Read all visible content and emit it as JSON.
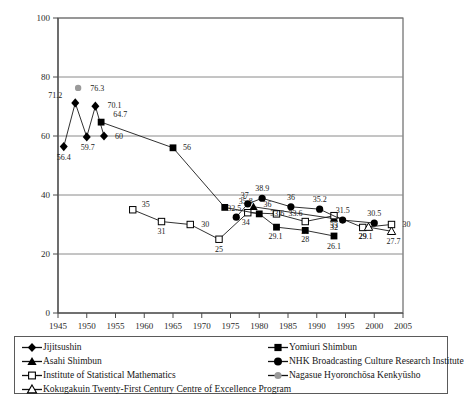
{
  "chart_data": {
    "type": "line",
    "title": "",
    "xlabel": "",
    "ylabel": "",
    "xlim": [
      1945,
      2005
    ],
    "ylim": [
      0,
      100
    ],
    "xticks": [
      1945,
      1950,
      1955,
      1960,
      1965,
      1970,
      1975,
      1980,
      1985,
      1990,
      1995,
      2000,
      2005
    ],
    "yticks": [
      0,
      20,
      40,
      60,
      80,
      100
    ],
    "grid": true,
    "legend_position": "below-plot",
    "series": [
      {
        "name": "Jijitsushin",
        "marker": "filled-diamond",
        "color": "#000000",
        "points": [
          {
            "x": 1946,
            "y": 56.4,
            "label": "56.4"
          },
          {
            "x": 1948,
            "y": 71.2,
            "label": "71.2"
          },
          {
            "x": 1950,
            "y": 59.7,
            "label": "59.7"
          },
          {
            "x": 1951.5,
            "y": 70.1,
            "label": "70.1"
          },
          {
            "x": 1953,
            "y": 60,
            "label": "60"
          }
        ]
      },
      {
        "name": "Asahi Shimbun",
        "marker": "filled-triangle",
        "color": "#000000",
        "points": [
          {
            "x": 1979,
            "y": 36,
            "label": "36"
          },
          {
            "x": 1993,
            "y": 32,
            "label": "32"
          }
        ]
      },
      {
        "name": "Institute of Statistical Mathematics",
        "marker": "open-square",
        "color": "#000000",
        "points": [
          {
            "x": 1958,
            "y": 35,
            "label": "35"
          },
          {
            "x": 1963,
            "y": 31,
            "label": "31"
          },
          {
            "x": 1968,
            "y": 30,
            "label": "30"
          },
          {
            "x": 1973,
            "y": 25,
            "label": "25"
          },
          {
            "x": 1978,
            "y": 34,
            "label": "34"
          },
          {
            "x": 1983,
            "y": 33.6,
            "label": "33.6"
          },
          {
            "x": 1988,
            "y": 31,
            "label": "31"
          },
          {
            "x": 1993,
            "y": 33,
            "label": "33"
          },
          {
            "x": 1998,
            "y": 29,
            "label": "29"
          },
          {
            "x": 2003,
            "y": 30,
            "label": "30"
          }
        ]
      },
      {
        "name": "Kokugakuin Twenty-First Century Centre of Excellence Program",
        "marker": "open-triangle",
        "color": "#000000",
        "points": [
          {
            "x": 1999,
            "y": 29.1,
            "label": "29.1"
          },
          {
            "x": 2003,
            "y": 27.7,
            "label": "27.7"
          }
        ]
      },
      {
        "name": "Yomiuri Shimbun",
        "marker": "filled-square",
        "color": "#000000",
        "points": [
          {
            "x": 1952.5,
            "y": 64.7,
            "label": "64.7"
          },
          {
            "x": 1965,
            "y": 56,
            "label": "56"
          },
          {
            "x": 1974,
            "y": 35.8,
            "label": "35.8"
          },
          {
            "x": 1980,
            "y": 33.6,
            "label": "33.6"
          },
          {
            "x": 1983,
            "y": 29.1,
            "label": "29.1"
          },
          {
            "x": 1988,
            "y": 28,
            "label": "28"
          },
          {
            "x": 1993,
            "y": 26.1,
            "label": "26.1"
          }
        ]
      },
      {
        "name": "NHK Broadcasting Culture Research Institute",
        "marker": "filled-circle",
        "color": "#000000",
        "points": [
          {
            "x": 1976,
            "y": 32.5,
            "label": "32.5"
          },
          {
            "x": 1978,
            "y": 37,
            "label": "37"
          },
          {
            "x": 1980.5,
            "y": 38.9,
            "label": "38.9"
          },
          {
            "x": 1985.5,
            "y": 36,
            "label": "36"
          },
          {
            "x": 1990.5,
            "y": 35.2,
            "label": "35.2"
          },
          {
            "x": 1994.5,
            "y": 31.5,
            "label": "31.5"
          },
          {
            "x": 2000,
            "y": 30.5,
            "label": "30.5"
          }
        ]
      },
      {
        "name": "Nagasue Hyoronchōsa Kenkyūsho",
        "marker": "gray-circle",
        "color": "#888888",
        "points": [
          {
            "x": 1948.5,
            "y": 76.3,
            "label": "76.3"
          }
        ]
      }
    ]
  },
  "legend": {
    "left_items": [
      {
        "label": "Jijitsushin",
        "marker": "filled-diamond"
      },
      {
        "label": "Asahi Shimbun",
        "marker": "filled-triangle"
      },
      {
        "label": "Institute of Statistical Mathematics",
        "marker": "open-square"
      },
      {
        "label": "Kokugakuin Twenty-First Century Centre of Excellence Program",
        "marker": "open-triangle"
      }
    ],
    "right_items": [
      {
        "label": "Yomiuri Shimbun",
        "marker": "filled-square"
      },
      {
        "label": "NHK Broadcasting Culture Research Institute",
        "marker": "filled-circle"
      },
      {
        "label": "Nagasue Hyoronchōsa Kenkyūsho",
        "marker": "gray-circle"
      }
    ]
  },
  "colors": {
    "axis": "#4a4a4a",
    "grid": "#8a8a8a",
    "marker": "#000000",
    "gray_marker": "#9a9a9a"
  }
}
